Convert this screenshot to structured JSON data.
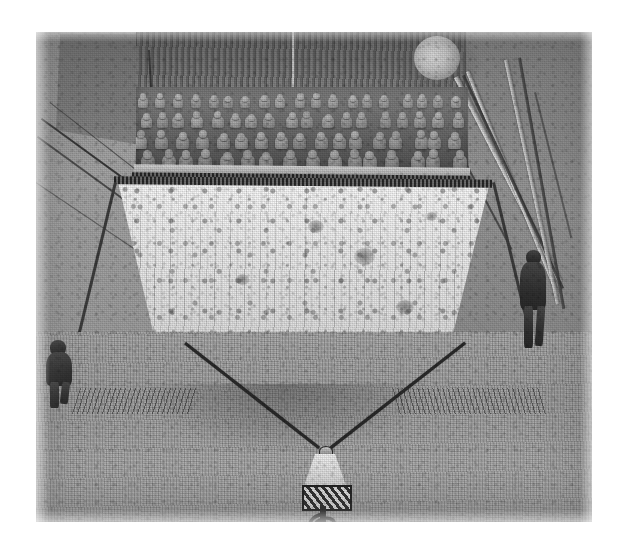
{
  "artwork": {
    "title": "Cinema Interior with Audience Balcony and Suspended Screen",
    "medium": "Charcoal and graphite drawing, grayscale reproduction",
    "orientation": "landscape",
    "canvas": {
      "width_px": 624,
      "height_px": 555,
      "background": "#ffffff"
    },
    "plate": {
      "left_px": 36,
      "top_px": 32,
      "width_px": 556,
      "height_px": 490
    }
  },
  "palette": {
    "paper_white": "#ffffff",
    "screen_light": "#f4f4f4",
    "screen_mid": "#dcdcdc",
    "floor_gray": "#a2a2a2",
    "wall_gray": "#8f8f8f",
    "wall_dark": "#6e6e6e",
    "band_dark": "#5a5a5a",
    "ink_black": "#2b2b2b",
    "figure_dark": "#333333",
    "moon_glow": "#f2f2f2"
  },
  "scene": {
    "name": "theater-interior",
    "elements": [
      {
        "name": "ceiling-dark-band",
        "description": "Dark textured band across top of frame with vertical seam"
      },
      {
        "name": "moon-light",
        "description": "Circular pale glowing orb near upper right, moon or ceiling lamp"
      },
      {
        "name": "balcony-gallery",
        "description": "Gallery box filled with a dense crowd of small seated figures"
      },
      {
        "name": "audience-crowd",
        "description": "Rows of pale round-headed spectators in the balcony",
        "row_count": 4,
        "approx_figure_count": 78
      },
      {
        "name": "balcony-rail",
        "description": "Dark beaded railing beneath the gallery"
      },
      {
        "name": "projection-screen",
        "description": "Large trapezoidal pale screen suspended below the balcony, speckled and streaked"
      },
      {
        "name": "suspension-cables",
        "description": "Two dark cables running from the lower screen corners down to the projector"
      },
      {
        "name": "projector-lamp",
        "description": "Small lamp-shaped projector standing on the floor with a trailing cord"
      },
      {
        "name": "figure-left",
        "description": "Dark standing figure at left edge of the floor"
      },
      {
        "name": "figure-right",
        "description": "Dark standing figure at right side of the floor"
      },
      {
        "name": "left-wall-cables",
        "description": "Long diagonal cables across the left wall"
      },
      {
        "name": "right-wall-poles",
        "description": "Pale diagonal poles or beams crossing the right wall"
      },
      {
        "name": "floor",
        "description": "Broad grainy gray floor occupying the lower half"
      }
    ]
  },
  "crowd_rows": [
    {
      "row": 1,
      "y": 6,
      "count": 19,
      "scale": 0.78
    },
    {
      "row": 2,
      "y": 24,
      "count": 18,
      "scale": 0.88
    },
    {
      "row": 3,
      "y": 43,
      "count": 17,
      "scale": 1.0
    },
    {
      "row": 4,
      "y": 62,
      "count": 16,
      "scale": 1.08
    }
  ],
  "screen_blobs": [
    {
      "x": 212,
      "y": 38,
      "w": 16,
      "h": 13
    },
    {
      "x": 258,
      "y": 66,
      "w": 21,
      "h": 17
    },
    {
      "x": 140,
      "y": 92,
      "w": 13,
      "h": 11
    },
    {
      "x": 300,
      "y": 118,
      "w": 18,
      "h": 14
    },
    {
      "x": 96,
      "y": 150,
      "w": 15,
      "h": 12
    },
    {
      "x": 196,
      "y": 160,
      "w": 12,
      "h": 10
    },
    {
      "x": 330,
      "y": 30,
      "w": 11,
      "h": 9
    }
  ]
}
